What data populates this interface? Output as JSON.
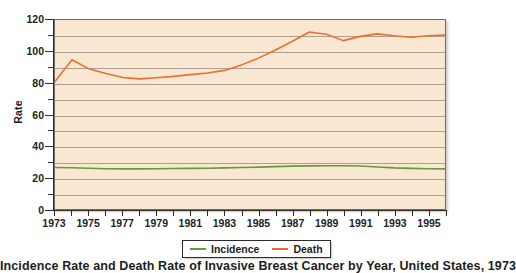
{
  "chart_data": {
    "type": "line",
    "title": "",
    "caption": "Incidence Rate and Death Rate of Invasive Breast Cancer by Year, United States, 1973",
    "xlabel": "",
    "ylabel": "Rate",
    "xlim": [
      1973,
      1996
    ],
    "ylim": [
      0,
      120
    ],
    "grid": true,
    "grid_interval": 10,
    "legend_position": "bottom-center",
    "x": [
      1973,
      1974,
      1975,
      1976,
      1977,
      1978,
      1979,
      1980,
      1981,
      1982,
      1983,
      1984,
      1985,
      1986,
      1987,
      1988,
      1989,
      1990,
      1991,
      1992,
      1993,
      1994,
      1995,
      1996
    ],
    "y_major_ticks": [
      0,
      20,
      40,
      60,
      80,
      100,
      120
    ],
    "y_minor_ticks": [
      10,
      30,
      50,
      70,
      90,
      110
    ],
    "x_tick_labels": [
      "1973",
      "1975",
      "1977",
      "1979",
      "1981",
      "1983",
      "1985",
      "1987",
      "1989",
      "1991",
      "1993",
      "1995"
    ],
    "series": [
      {
        "name": "Incidence",
        "color": "#5f9c3a",
        "values": [
          26.3,
          26.2,
          25.9,
          25.6,
          25.5,
          25.5,
          25.6,
          25.7,
          25.8,
          25.9,
          26.1,
          26.3,
          26.6,
          26.9,
          27.2,
          27.4,
          27.5,
          27.5,
          27.3,
          26.7,
          26.1,
          25.8,
          25.6,
          25.5
        ]
      },
      {
        "name": "Death",
        "color": "#e8702f",
        "values": [
          81.0,
          94.8,
          89.0,
          86.0,
          83.5,
          82.6,
          83.3,
          84.2,
          85.3,
          86.3,
          88.0,
          91.5,
          95.8,
          101.0,
          106.5,
          112.4,
          111.0,
          106.9,
          109.6,
          111.2,
          110.0,
          109.1,
          110.0,
          110.5
        ]
      }
    ]
  },
  "legend": {
    "items": [
      {
        "label": "Incidence",
        "color": "#5f9c3a"
      },
      {
        "label": "Death",
        "color": "#e8702f"
      }
    ]
  },
  "axis": {
    "y_title": "Rate"
  }
}
